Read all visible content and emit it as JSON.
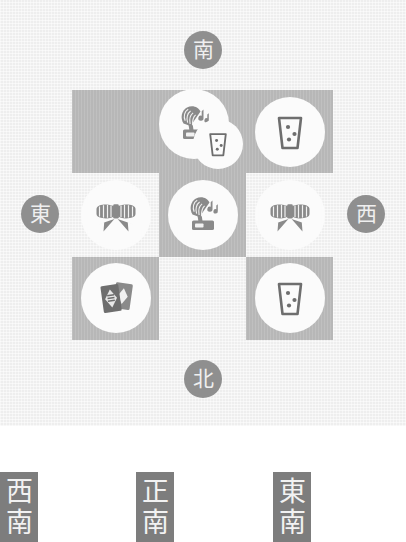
{
  "board": {
    "compass": [
      {
        "name": "south",
        "glyph": "南",
        "position": "top"
      },
      {
        "name": "west",
        "glyph": "西",
        "position": "right"
      },
      {
        "name": "north",
        "glyph": "北",
        "position": "bottom"
      },
      {
        "name": "east",
        "glyph": "東",
        "position": "left"
      }
    ],
    "colors": {
      "panel_background": "#eeeeee",
      "shaded_cell": "#b7b7b7",
      "tile_disc": "#fbfbfb",
      "badge": "#8f8f8f",
      "chip": "#7d7d7d",
      "icon_dark": "#6e6e6e",
      "icon_mid": "#8a8a8a"
    },
    "grid": {
      "rows": 3,
      "columns": 3,
      "cells": [
        {
          "row": 0,
          "col": 0,
          "shaded": true,
          "tiles": []
        },
        {
          "row": 0,
          "col": 1,
          "shaded": true,
          "tiles": [
            {
              "icon": "gramophone-icon",
              "size": "large"
            },
            {
              "icon": "drinking-glass-icon",
              "size": "small"
            }
          ]
        },
        {
          "row": 0,
          "col": 2,
          "shaded": true,
          "tiles": [
            {
              "icon": "drinking-glass-icon",
              "size": "large"
            }
          ]
        },
        {
          "row": 1,
          "col": 0,
          "shaded": false,
          "tiles": [
            {
              "icon": "ribbon-bow-icon",
              "size": "large"
            }
          ]
        },
        {
          "row": 1,
          "col": 1,
          "shaded": true,
          "tiles": [
            {
              "icon": "gramophone-icon",
              "size": "large"
            }
          ]
        },
        {
          "row": 1,
          "col": 2,
          "shaded": false,
          "tiles": [
            {
              "icon": "ribbon-bow-icon",
              "size": "large"
            }
          ]
        },
        {
          "row": 2,
          "col": 0,
          "shaded": true,
          "tiles": [
            {
              "icon": "playing-cards-icon",
              "size": "large"
            }
          ]
        },
        {
          "row": 2,
          "col": 1,
          "shaded": false,
          "tiles": []
        },
        {
          "row": 2,
          "col": 2,
          "shaded": true,
          "tiles": [
            {
              "icon": "drinking-glass-icon",
              "size": "large"
            }
          ]
        }
      ]
    }
  },
  "direction_labels": [
    {
      "name": "southwest",
      "chars": [
        "西",
        "南"
      ]
    },
    {
      "name": "due-south",
      "chars": [
        "正",
        "南"
      ]
    },
    {
      "name": "southeast",
      "chars": [
        "東",
        "南"
      ]
    }
  ]
}
